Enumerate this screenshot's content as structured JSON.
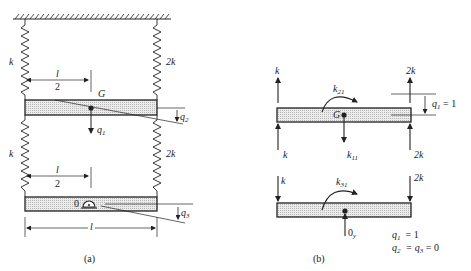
{
  "figure": {
    "panel_a": {
      "caption": "(a)",
      "springs": {
        "upper_left": "k",
        "upper_right": "2k",
        "lower_left": "k",
        "lower_right": "2k"
      },
      "upper_half_length": {
        "num": "l",
        "den": "2"
      },
      "lower_half_length": {
        "num": "l",
        "den": "2"
      },
      "center_of_mass": "G",
      "coord_q1": {
        "base": "q",
        "sub": "1"
      },
      "coord_q2": {
        "base": "q",
        "sub": "2"
      },
      "coord_q3": {
        "base": "q",
        "sub": "3"
      },
      "pivot": "0",
      "length": "l"
    },
    "panel_b": {
      "caption": "(b)",
      "upper": {
        "left_top": "k",
        "left_bottom": "k",
        "right_top": "2k",
        "right_bottom": "2k",
        "moment": {
          "base": "k",
          "sub": "21"
        },
        "force": {
          "base": "k",
          "sub": "11"
        },
        "center_of_mass": "G",
        "displacement": {
          "base": "q",
          "sub": "1",
          "rest": " = 1"
        }
      },
      "lower": {
        "left": "k",
        "right": "2k",
        "moment": {
          "base": "k",
          "sub": "31"
        },
        "reaction": {
          "base": "0",
          "sub": "y"
        }
      },
      "conditions": {
        "line1": {
          "base": "q",
          "sub": "1",
          "rest": "  = 1"
        },
        "line2": {
          "base": "q",
          "sub": "2",
          "mid": "  = q",
          "sub2": "3",
          "rest": " = 0"
        }
      }
    },
    "colors": {
      "ink": "#222222",
      "beam_fill": "#e3e3e3",
      "background": "#ffffff"
    }
  }
}
